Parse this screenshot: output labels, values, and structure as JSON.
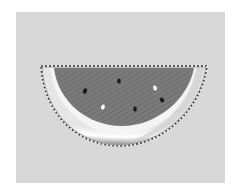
{
  "image": {
    "subject": "watermelon-slice",
    "selection": "marching-ants",
    "colors": {
      "background_panel": "#d8d8d8",
      "flesh": "#7a7a7a",
      "rind_highlight": "#f2f2f2",
      "rind_shadow": "#9a9a9a",
      "seed_dark": "#1a1a1a",
      "seed_light": "#ffffff"
    }
  },
  "caption": {
    "text": ""
  }
}
